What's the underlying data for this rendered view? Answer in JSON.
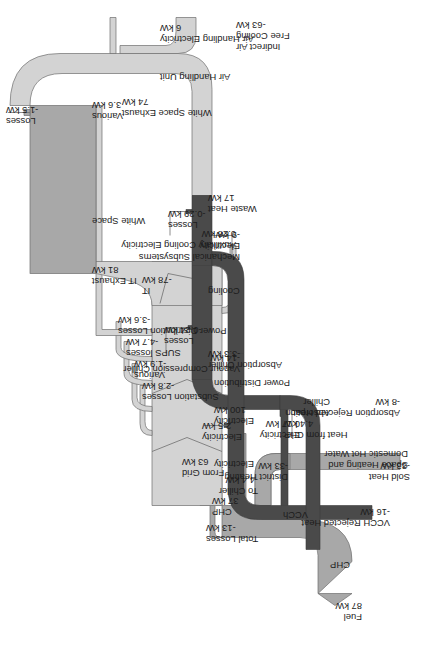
{
  "diagram": {
    "type": "sankey",
    "orientation": "rotated-90",
    "units": "kW",
    "colors": {
      "flow_light": "#d3d3d3",
      "flow_mid": "#a8a8a8",
      "flow_dark": "#4a4a4a",
      "stroke": "#6e6e6e",
      "text": "#1c1c1c",
      "background": "#ffffff"
    }
  },
  "nodes": [
    {
      "id": "chp",
      "label": "CHP"
    },
    {
      "id": "power_distribution",
      "label": "Power Distribution"
    },
    {
      "id": "white_space",
      "label": "White Space"
    },
    {
      "id": "air_handling_unit",
      "label": "Air Handling Unit"
    },
    {
      "id": "cooling",
      "label": "Cooling"
    },
    {
      "id": "absorption_chiller",
      "label": "Absorption\nChiller"
    },
    {
      "id": "vapour_compression_chiller",
      "label": "Vapour Compression Chiller"
    },
    {
      "id": "vcch",
      "label": "VCCh"
    },
    {
      "id": "space_heating",
      "label": "Space Heating and\nDomestic Hot Water"
    }
  ],
  "flows": [
    {
      "name": "Fuel",
      "value": 87,
      "value_label": "87 kW",
      "sign": "in"
    },
    {
      "name": "Total Losses",
      "value": -13,
      "value_label": "-13 kW",
      "sign": "out"
    },
    {
      "name": "CHP",
      "value": 37,
      "value_label": "37 kW",
      "sign": "in"
    },
    {
      "name": "From Grid",
      "value": 63,
      "value_label": "63 kW",
      "sign": "in"
    },
    {
      "name": "Electricity",
      "value": 100,
      "value_label": "100 kW",
      "sign": "in"
    },
    {
      "name": "To Chiller",
      "value": -4.4,
      "value_label": "-4.4 kW",
      "sign": "out"
    },
    {
      "name": "District Heating",
      "value": -33,
      "value_label": "-33 kW",
      "sign": "out"
    },
    {
      "name": "Sold Heat",
      "value": -33,
      "value_label": "-33 kW",
      "sign": "out"
    },
    {
      "name": "Substation Losses",
      "value": -2.8,
      "value_label": "-2.8 kW",
      "sign": "out"
    },
    {
      "name": "Various",
      "value": -1.9,
      "value_label": "-1.9 kW",
      "sign": "out"
    },
    {
      "name": "SUPS losses",
      "value": -4.7,
      "value_label": "-4.7 kW",
      "sign": "out"
    },
    {
      "name": "Power Distribution Losses",
      "value": -3.6,
      "value_label": "-3.6 kW",
      "sign": "out"
    },
    {
      "name": "Various",
      "value": 3.6,
      "value_label": "3.6 kW",
      "sign": "in"
    },
    {
      "name": "IT",
      "value": -78,
      "value_label": "-78 kW",
      "sign": "out"
    },
    {
      "name": "IT Exhaust",
      "value": 81,
      "value_label": "81 kW",
      "sign": "in"
    },
    {
      "name": "Mechanical Subsystems Electricity",
      "value": -9,
      "value_label": "-9 kW",
      "sign": "out"
    },
    {
      "name": "Losses",
      "value": -1.5,
      "value_label": "-1.5 kW",
      "sign": "out"
    },
    {
      "name": "White Space Exhaust",
      "value": 74,
      "value_label": "74 kW",
      "sign": "in"
    },
    {
      "name": "Air Handling Electricity",
      "value": 6,
      "value_label": "6 kW",
      "sign": "in"
    },
    {
      "name": "Indirect Air Free Cooling",
      "value": -63,
      "value_label": "-63 kW",
      "sign": "out"
    },
    {
      "name": "Waste Heat",
      "value": 17,
      "value_label": "17 kW",
      "sign": "in"
    },
    {
      "name": "Losses",
      "value": -0.29,
      "value_label": "-0.29 kW",
      "sign": "out"
    },
    {
      "name": "Auxilliary Cooling Electricity",
      "value": 0.28,
      "value_label": "0.28 kW",
      "sign": "in"
    },
    {
      "name": "Losses",
      "value": -0.24,
      "value_label": "-0.24 kW",
      "sign": "out"
    },
    {
      "name": "Absorption Chiller",
      "value": -3.3,
      "value_label": "-3.3 kW",
      "sign": "out"
    },
    {
      "name": "Vapour Compression Chiller",
      "value": -14,
      "value_label": "-14 kW",
      "sign": "out"
    },
    {
      "name": "Heat from CHP",
      "value": 4.4,
      "value_label": "4.4 kW",
      "sign": "in"
    },
    {
      "name": "Electricity",
      "value": 0.17,
      "value_label": "0.17 kW",
      "sign": "in"
    },
    {
      "name": "Absorption Rejected Heat",
      "value": -8,
      "value_label": "-8 kW",
      "sign": "out"
    },
    {
      "name": "Electricity",
      "value": 2.5,
      "value_label": "2.5 kW",
      "sign": "in"
    },
    {
      "name": "VCCH Rejected Heat",
      "value": -16,
      "value_label": "-16 kW",
      "sign": "out"
    }
  ],
  "labels": {
    "fuel_name": "Fuel",
    "fuel_value": "87 kW",
    "total_losses_name": "Total Losses",
    "total_losses_value": "-13 kW",
    "chp_node": "CHP",
    "chp_elec_name": "CHP",
    "chp_elec_value": "37 kW",
    "from_grid_name": "From Grid",
    "from_grid_value": "63 kW",
    "electricity_name": "Electricity",
    "electricity_100_name": "Electricity",
    "electricity_100_value": "100 kW",
    "power_distribution_node": "Power Distribution",
    "to_chiller_name": "To Chiller",
    "to_chiller_value": "-4.4 kW",
    "district_heating_name": "District Heating",
    "district_heating_value": "-33 kW",
    "sold_heat_name": "Sold Heat",
    "sold_heat_value": "-33 kW",
    "space_heating_node_l1": "Space Heating and",
    "space_heating_node_l2": "Domestic Hot Water",
    "substation_losses_name": "Substation Losses",
    "substation_losses_value": "-2.8 kW",
    "various_neg_name": "Various",
    "various_neg_value": "-1.9 kW",
    "sups_losses_name": "SUPS losses",
    "sups_losses_value": "-4.7 kW",
    "pdl_name": "Power Distribution Losses",
    "pdl_value": "-3.6 kW",
    "various_pos_name": "Various",
    "various_pos_value": "3.6 kW",
    "it_name": "IT",
    "it_value": "-78 kW",
    "it_exhaust_name": "IT Exhaust",
    "it_exhaust_value": "81 kW",
    "white_space_node": "White Space",
    "mech_sub_l1": "Mechanical Subsystems",
    "mech_sub_l2": "Electricity",
    "mech_sub_value": "-9 kW",
    "ws_losses_name": "Losses",
    "ws_losses_value": "-1.5 kW",
    "ws_exhaust_name": "White Space Exhaust",
    "ws_exhaust_value": "74 kW",
    "ahu_node": "Air Handling Unit",
    "ahu_elec_name": "Air Handling Electricity",
    "ahu_elec_value": "6 kW",
    "iafc_l1": "Indirect Air",
    "iafc_l2": "Free Cooling",
    "iafc_value": "-63 kW",
    "waste_heat_name": "Waste Heat",
    "waste_heat_value": "17 kW",
    "cool_losses_name": "Losses",
    "cool_losses_value": "-0.29 kW",
    "aux_cool_name": "Auxilliary Cooling Electricity",
    "aux_cool_value": "0.28 kW",
    "cooling_node": "Cooling",
    "abs_losses_name": "Losses",
    "abs_losses_value": "-0.24 kW",
    "abs_chiller_name": "Absorption Chiller",
    "abs_chiller_value": "-3.3 kW",
    "vcc_name": "Vapour Compression Chiller",
    "vcc_value": "-14 kW",
    "heat_from_chp_name": "Heat from CHP",
    "heat_from_chp_value": "4.4 kW",
    "abs_elec_name": "Electricity",
    "abs_elec_value": "0.17 kW",
    "abs_chiller_node_l1": "Absorption",
    "abs_chiller_node_l2": "Chiller",
    "abs_rej_name": "Absorption Rejected Heat",
    "abs_rej_value": "-8 kW",
    "vcch_elec_name": "Electricity",
    "vcch_elec_value": "2.5 kW",
    "vcch_node": "VCCh",
    "vcch_rej_name": "VCCH Rejected Heat",
    "vcch_rej_value": "-16 kW"
  }
}
